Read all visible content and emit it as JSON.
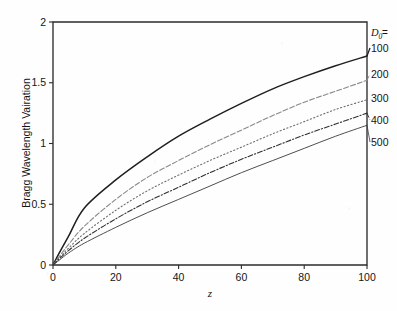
{
  "chart_data": {
    "type": "line",
    "title": "",
    "xlabel": "z",
    "ylabel": "Bragg Wavelength Vairation",
    "xlim": [
      0,
      100
    ],
    "ylim": [
      0,
      2
    ],
    "xticks": [
      0,
      20,
      40,
      60,
      80,
      100
    ],
    "yticks": [
      0,
      0.5,
      1,
      1.5,
      2
    ],
    "xtick_labels": [
      "0",
      "20",
      "40",
      "60",
      "80",
      "100"
    ],
    "ytick_labels": [
      "0",
      "0.5",
      "1",
      "1.5",
      "2"
    ],
    "grid": false,
    "legend_position": "right-outside",
    "legend_title": "D",
    "legend_title_sub": "0",
    "legend_title_eq": "=",
    "x": [
      0,
      2,
      5,
      10,
      20,
      30,
      40,
      50,
      60,
      70,
      80,
      90,
      100
    ],
    "series": [
      {
        "name": "100",
        "label": "100",
        "style": "solid",
        "color": "#1f1f1f",
        "width": 1.5,
        "end_value": 1.72,
        "values": [
          0.0,
          0.1,
          0.24,
          0.47,
          0.7,
          0.89,
          1.06,
          1.2,
          1.33,
          1.45,
          1.55,
          1.64,
          1.72
        ]
      },
      {
        "name": "200",
        "label": "200",
        "style": "dashed-light",
        "color": "#8a8a8a",
        "width": 1.1,
        "end_value": 1.52,
        "values": [
          0.0,
          0.07,
          0.17,
          0.32,
          0.54,
          0.72,
          0.86,
          0.99,
          1.11,
          1.23,
          1.34,
          1.43,
          1.52
        ]
      },
      {
        "name": "300",
        "label": "300",
        "style": "dotted",
        "color": "#6e6e6e",
        "width": 1.1,
        "end_value": 1.36,
        "values": [
          0.0,
          0.06,
          0.14,
          0.26,
          0.45,
          0.61,
          0.74,
          0.86,
          0.97,
          1.08,
          1.18,
          1.28,
          1.36
        ]
      },
      {
        "name": "400",
        "label": "400",
        "style": "dash-dot",
        "color": "#303030",
        "width": 1.1,
        "end_value": 1.25,
        "values": [
          0.0,
          0.05,
          0.12,
          0.22,
          0.38,
          0.52,
          0.64,
          0.76,
          0.87,
          0.97,
          1.07,
          1.16,
          1.25
        ]
      },
      {
        "name": "500",
        "label": "500",
        "style": "solid-thin",
        "color": "#3a3a3a",
        "width": 0.9,
        "end_value": 1.15,
        "values": [
          0.0,
          0.04,
          0.1,
          0.18,
          0.31,
          0.43,
          0.54,
          0.65,
          0.76,
          0.86,
          0.96,
          1.06,
          1.15
        ]
      }
    ]
  },
  "figure": {
    "frame_color": "#2b2b2b",
    "background": "#fefefe"
  }
}
